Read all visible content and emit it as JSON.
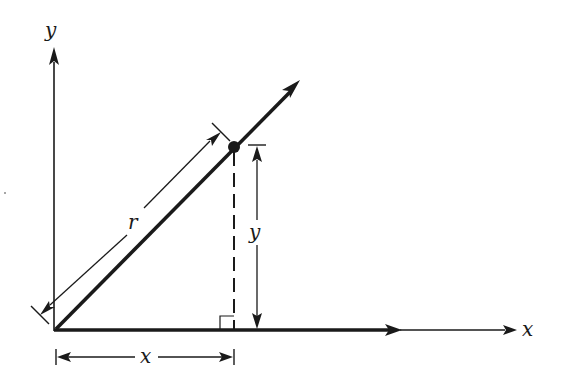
{
  "diagram": {
    "labels": {
      "y_axis": "y",
      "x_axis": "x",
      "r_dimension": "r",
      "y_dimension": "y",
      "x_dimension": "x"
    },
    "colors": {
      "stroke": "#1a1a1a",
      "background": "#ffffff"
    },
    "elements": [
      "y-axis with arrow",
      "x-axis with arrow (thick segment then thin)",
      "thick ray from origin with arrowhead",
      "point on ray",
      "dashed perpendicular from point to x-axis",
      "right-angle marker",
      "r dimension line",
      "y dimension line",
      "x dimension line"
    ]
  }
}
